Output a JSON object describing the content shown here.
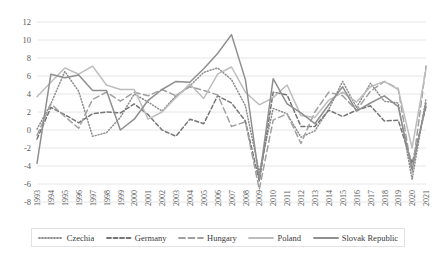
{
  "chart_data": {
    "type": "line",
    "title": "",
    "xlabel": "",
    "ylabel": "",
    "ylim": [
      -8,
      12
    ],
    "yticks": [
      12,
      10,
      8,
      6,
      4,
      2,
      0,
      -2,
      -4,
      -6,
      -8
    ],
    "grid": true,
    "legend_position": "bottom",
    "x": [
      1993,
      1994,
      1995,
      1996,
      1997,
      1998,
      1999,
      2000,
      2001,
      2002,
      2003,
      2004,
      2005,
      2006,
      2007,
      2008,
      2009,
      2010,
      2011,
      2012,
      2013,
      2014,
      2015,
      2016,
      2017,
      2018,
      2019,
      2020,
      2021
    ],
    "categories": [
      "1993",
      "1994",
      "1995",
      "1996",
      "1997",
      "1998",
      "1999",
      "2000",
      "2001",
      "2002",
      "2003",
      "2004",
      "2005",
      "2006",
      "2007",
      "2008",
      "2009",
      "2010",
      "2011",
      "2012",
      "2013",
      "2014",
      "2015",
      "2016",
      "2017",
      "2018",
      "2019",
      "2020",
      "2021"
    ],
    "series": [
      {
        "name": "Czechia",
        "style": "dotted",
        "color": "#8c8c8c",
        "values": [
          0.1,
          2.9,
          6.5,
          4.3,
          -0.7,
          -0.3,
          1.4,
          4.0,
          3.1,
          2.1,
          3.8,
          4.9,
          6.4,
          6.9,
          5.6,
          2.7,
          -4.7,
          2.4,
          1.8,
          -0.8,
          -0.1,
          2.3,
          5.4,
          2.5,
          5.2,
          3.2,
          3.0,
          -5.5,
          3.5
        ]
      },
      {
        "name": "Germany",
        "style": "dashed",
        "color": "#757575",
        "values": [
          -1.0,
          2.5,
          1.7,
          0.8,
          1.8,
          2.0,
          1.9,
          2.9,
          1.7,
          0.0,
          -0.7,
          1.2,
          0.7,
          3.8,
          3.0,
          1.0,
          -5.7,
          4.2,
          3.9,
          0.4,
          0.4,
          2.2,
          1.5,
          2.2,
          2.7,
          1.0,
          1.1,
          -3.7,
          2.6
        ]
      },
      {
        "name": "Hungary",
        "style": "longdash",
        "color": "#a0a0a0",
        "values": [
          -0.6,
          2.9,
          1.5,
          0.2,
          3.4,
          4.2,
          3.2,
          4.2,
          3.8,
          4.5,
          3.8,
          4.8,
          4.4,
          3.9,
          0.4,
          0.9,
          -6.6,
          1.1,
          1.8,
          -1.5,
          2.0,
          4.2,
          3.8,
          2.2,
          4.3,
          5.4,
          4.6,
          -4.7,
          7.1
        ]
      },
      {
        "name": "Poland",
        "style": "solid",
        "color": "#bdbdbd",
        "values": [
          3.7,
          5.3,
          6.9,
          6.2,
          7.1,
          5.0,
          4.5,
          4.5,
          1.2,
          2.0,
          3.6,
          5.1,
          3.5,
          6.2,
          7.0,
          4.2,
          2.8,
          3.6,
          5.0,
          1.6,
          1.4,
          3.3,
          4.2,
          3.1,
          4.8,
          5.4,
          4.5,
          -2.0,
          6.8
        ]
      },
      {
        "name": "Slovak Republic",
        "style": "solid",
        "color": "#8f8f8f",
        "values": [
          -3.7,
          6.2,
          5.8,
          6.1,
          4.4,
          4.4,
          0.0,
          1.2,
          3.3,
          4.5,
          5.4,
          5.3,
          6.8,
          8.5,
          10.6,
          5.6,
          -5.5,
          5.7,
          2.9,
          1.9,
          0.7,
          2.8,
          4.8,
          2.1,
          3.0,
          3.8,
          2.6,
          -4.4,
          3.0
        ]
      }
    ]
  },
  "legend": {
    "items": [
      {
        "label": "Czechia"
      },
      {
        "label": "Germany"
      },
      {
        "label": "Hungary"
      },
      {
        "label": "Poland"
      },
      {
        "label": "Slovak Republic"
      }
    ]
  }
}
